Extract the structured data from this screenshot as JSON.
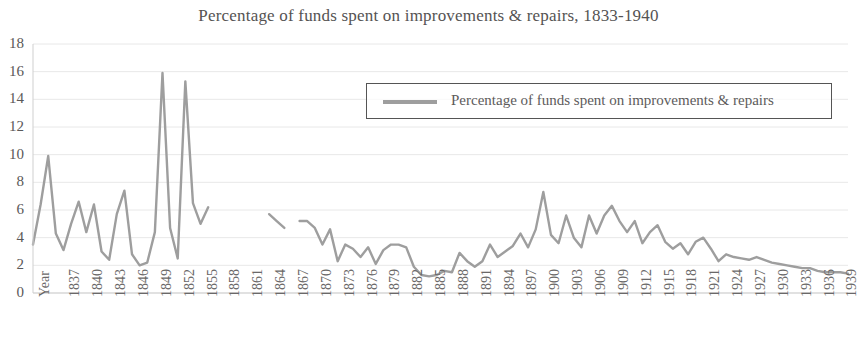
{
  "chart_data": {
    "type": "line",
    "title": "Percentage of funds spent on improvements & repairs, 1833-1940",
    "xlabel": "Year",
    "ylabel": "",
    "ylim": [
      0,
      18
    ],
    "ytick_step": 2,
    "yticks": [
      0,
      2,
      4,
      6,
      8,
      10,
      12,
      14,
      16,
      18
    ],
    "xlim": [
      1833,
      1940
    ],
    "xtick_step": 3,
    "xticks": [
      "Year",
      "1837",
      "1840",
      "1843",
      "1846",
      "1849",
      "1852",
      "1855",
      "1858",
      "1861",
      "1864",
      "1867",
      "1870",
      "1873",
      "1876",
      "1879",
      "1882",
      "1885",
      "1888",
      "1891",
      "1894",
      "1897",
      "1900",
      "1903",
      "1906",
      "1909",
      "1912",
      "1915",
      "1918",
      "1921",
      "1924",
      "1927",
      "1930",
      "1933",
      "1936",
      "1939"
    ],
    "grid": true,
    "legend_position": "top-right",
    "line_color": "#9e9e9e",
    "series": [
      {
        "name": "Percentage of funds spent on improvements & repairs",
        "x": [
          1833,
          1834,
          1835,
          1836,
          1837,
          1838,
          1839,
          1840,
          1841,
          1842,
          1843,
          1844,
          1845,
          1846,
          1847,
          1848,
          1849,
          1850,
          1851,
          1852,
          1853,
          1854,
          1855,
          1856,
          1864,
          1865,
          1866,
          1868,
          1869,
          1870,
          1871,
          1872,
          1873,
          1874,
          1875,
          1876,
          1877,
          1878,
          1879,
          1880,
          1881,
          1882,
          1883,
          1884,
          1885,
          1886,
          1887,
          1888,
          1889,
          1890,
          1891,
          1892,
          1893,
          1894,
          1895,
          1896,
          1897,
          1898,
          1899,
          1900,
          1901,
          1902,
          1903,
          1904,
          1905,
          1906,
          1907,
          1908,
          1909,
          1910,
          1911,
          1912,
          1913,
          1914,
          1915,
          1916,
          1917,
          1918,
          1919,
          1920,
          1921,
          1922,
          1923,
          1924,
          1925,
          1926,
          1927,
          1928,
          1929,
          1930,
          1931,
          1932,
          1933,
          1934,
          1935,
          1936,
          1937,
          1938,
          1939,
          1940
        ],
        "values": [
          3.5,
          6.4,
          9.9,
          4.3,
          3.1,
          5.0,
          6.6,
          4.4,
          6.4,
          3.0,
          2.4,
          5.7,
          7.4,
          2.8,
          2.0,
          2.2,
          4.4,
          15.9,
          4.7,
          2.5,
          15.3,
          6.5,
          5.0,
          6.2,
          5.7,
          5.2,
          4.7,
          5.2,
          5.2,
          4.7,
          3.5,
          4.6,
          2.3,
          3.5,
          3.2,
          2.6,
          3.3,
          2.1,
          3.1,
          3.5,
          3.5,
          3.3,
          1.9,
          1.3,
          1.2,
          1.3,
          1.6,
          1.5,
          2.9,
          2.3,
          1.9,
          2.3,
          3.5,
          2.6,
          3.0,
          3.4,
          4.3,
          3.3,
          4.6,
          7.3,
          4.2,
          3.6,
          5.6,
          4.0,
          3.3,
          5.6,
          4.3,
          5.6,
          6.3,
          5.2,
          4.4,
          5.2,
          3.6,
          4.4,
          4.9,
          3.7,
          3.2,
          3.6,
          2.8,
          3.7,
          4.0,
          3.2,
          2.3,
          2.8,
          2.6,
          2.5,
          2.4,
          2.6,
          2.4,
          2.2,
          2.1,
          2.0,
          1.9,
          1.8,
          1.8,
          1.6,
          1.5,
          1.5,
          1.5,
          1.4
        ],
        "gaps": [
          [
            1856,
            1864
          ],
          [
            1866,
            1868
          ]
        ]
      }
    ]
  },
  "legend": {
    "label": "Percentage of funds spent on improvements & repairs"
  }
}
